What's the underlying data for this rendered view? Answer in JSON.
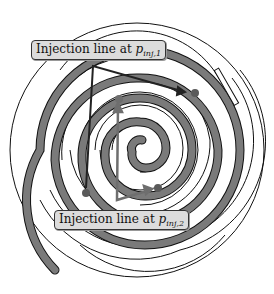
{
  "diagram": {
    "type": "scroll-compressor-injection",
    "labels": [
      {
        "id": "inj1",
        "text": "Injection line at ",
        "symbol": "p",
        "subscript": "inj,1"
      },
      {
        "id": "inj2",
        "text": "Injection line at ",
        "symbol": "p",
        "subscript": "inj,2"
      }
    ],
    "colors": {
      "spiral_fill": "#7a7a7a",
      "outline": "#111111",
      "label_bg": "#dcdcdc",
      "port_dot": "#5a5a5a",
      "injection_line": "#222222",
      "injection_line_2": "#6e6e6e"
    }
  }
}
